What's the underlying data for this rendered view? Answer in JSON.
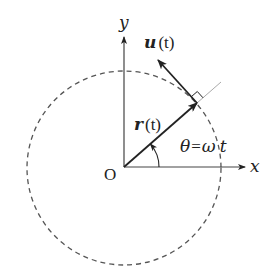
{
  "diagram": {
    "labels": {
      "y_axis": "y",
      "x_axis": "x",
      "origin": "O",
      "r_vector_bold": "r",
      "r_vector_arg": "(t)",
      "u_vector_bold": "u",
      "u_vector_arg": "(t)",
      "angle_theta": "θ",
      "angle_eq": "=",
      "angle_omega": "ω",
      "angle_t": "t"
    },
    "geometry": {
      "origin": [
        124,
        167
      ],
      "circle_radius": 97,
      "circle_style": "dashed",
      "angle_deg": 41,
      "r_tip": [
        197,
        103
      ],
      "u_tip": [
        158,
        60
      ],
      "radial_extension_end": [
        221,
        83
      ],
      "angle_arc_radius": 35
    },
    "colors": {
      "stroke": "#222222",
      "circle": "#555555",
      "extension": "#aaaaaa",
      "background": "#ffffff"
    }
  }
}
